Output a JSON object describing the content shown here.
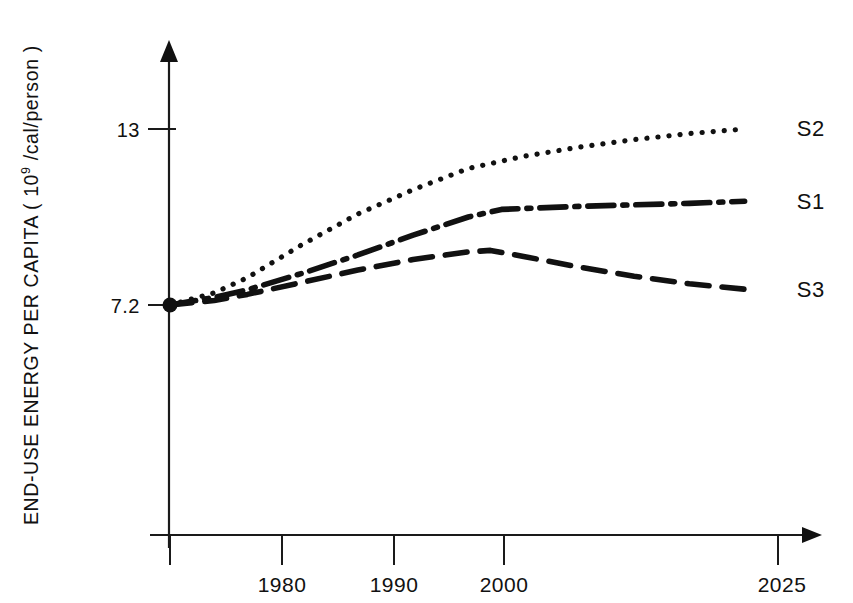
{
  "chart_data": {
    "type": "line",
    "title": "",
    "subtitle": "",
    "xlabel": "",
    "ylabel": "END-USE ENERGY PER CAPITA (10⁹/cal/person)",
    "ylabel_parts": {
      "pre": "END-USE ENERGY PER CAPITA ( 10",
      "sup": "9",
      "post": " /cal/person )"
    },
    "x_tick_labels": [
      "1980",
      "1990",
      "2000",
      "2025"
    ],
    "x_tick_values": [
      1980,
      1990,
      2000,
      2025
    ],
    "y_tick_labels": [
      "7.2",
      "13"
    ],
    "y_tick_values": [
      7.2,
      13
    ],
    "xlim": [
      1973,
      2031
    ],
    "ylim": [
      0,
      14.6
    ],
    "grid": false,
    "legend_position": "right-of-line-ends",
    "annotations": [
      {
        "text": "S2",
        "x": 2029,
        "y": 13.05
      },
      {
        "text": "S1",
        "x": 2029,
        "y": 10.62
      },
      {
        "text": "S3",
        "x": 2029,
        "y": 7.72
      }
    ],
    "origin_marker": {
      "x": 1973,
      "y": 7.2,
      "shape": "filled-circle"
    },
    "series": [
      {
        "name": "S2",
        "label": "S2",
        "style": "dotted",
        "color": "#111111",
        "x": [
          1973,
          1977,
          1980,
          1985,
          1990,
          1995,
          2000,
          2005,
          2010,
          2015,
          2020,
          2025
        ],
        "values": [
          7.2,
          7.6,
          8.1,
          9.2,
          10.2,
          11.0,
          11.7,
          12.1,
          12.4,
          12.65,
          12.85,
          13.0
        ]
      },
      {
        "name": "S1",
        "label": "S1",
        "style": "dash-dot",
        "color": "#111111",
        "x": [
          1973,
          1977,
          1980,
          1985,
          1990,
          1995,
          2000,
          2003,
          2010,
          2015,
          2020,
          2025
        ],
        "values": [
          7.2,
          7.45,
          7.7,
          8.25,
          8.85,
          9.5,
          10.1,
          10.35,
          10.45,
          10.5,
          10.55,
          10.62
        ]
      },
      {
        "name": "S3",
        "label": "S3",
        "style": "dashed",
        "color": "#111111",
        "x": [
          1973,
          1977,
          1980,
          1985,
          1990,
          1995,
          2000,
          2002,
          2005,
          2010,
          2015,
          2020,
          2025
        ],
        "values": [
          7.2,
          7.35,
          7.55,
          7.95,
          8.35,
          8.7,
          8.95,
          9.0,
          8.8,
          8.45,
          8.15,
          7.9,
          7.72
        ]
      }
    ]
  },
  "axes": {
    "y_arrow": "up-arrow-icon",
    "x_arrow": "right-arrow-icon"
  }
}
